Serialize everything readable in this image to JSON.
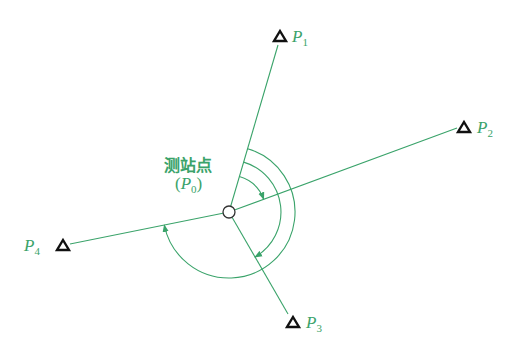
{
  "diagram": {
    "station_label": "测站点",
    "station_symbol": "P",
    "station_subscript": "0",
    "points": [
      {
        "name": "P",
        "sub": "1"
      },
      {
        "name": "P",
        "sub": "2"
      },
      {
        "name": "P",
        "sub": "3"
      },
      {
        "name": "P",
        "sub": "4"
      }
    ],
    "colors": {
      "line": "#3aa36a",
      "triangle": "#111111",
      "label": "#3aa36a"
    }
  }
}
